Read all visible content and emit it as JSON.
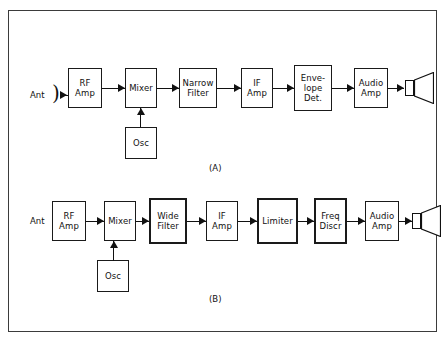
{
  "figure": {
    "frame_color": "#3b3b3b",
    "line_color": "#111111",
    "background": "#ffffff"
  },
  "diagram_a": {
    "caption": "(A)",
    "antenna_label": "Ant",
    "antenna_symbol": ")",
    "speaker_name": "loudspeaker",
    "blocks": [
      {
        "id": "rf_amp",
        "label": "RF\nAmp",
        "emphasis": "normal"
      },
      {
        "id": "mixer",
        "label": "Mixer",
        "emphasis": "normal"
      },
      {
        "id": "osc",
        "label": "Osc",
        "emphasis": "normal"
      },
      {
        "id": "narrow_filter",
        "label": "Narrow\nFilter",
        "emphasis": "normal"
      },
      {
        "id": "if_amp",
        "label": "IF\nAmp",
        "emphasis": "normal"
      },
      {
        "id": "env_det",
        "label": "Enve-\nlope\nDet.",
        "emphasis": "normal"
      },
      {
        "id": "audio_amp",
        "label": "Audio\nAmp",
        "emphasis": "normal"
      }
    ]
  },
  "diagram_b": {
    "caption": "(B)",
    "antenna_label": "Ant",
    "antenna_symbol": ")",
    "speaker_name": "loudspeaker",
    "blocks": [
      {
        "id": "rf_amp",
        "label": "RF\nAmp",
        "emphasis": "normal"
      },
      {
        "id": "mixer",
        "label": "Mixer",
        "emphasis": "normal"
      },
      {
        "id": "osc",
        "label": "Osc",
        "emphasis": "normal"
      },
      {
        "id": "wide_filter",
        "label": "Wide\nFilter",
        "emphasis": "bold"
      },
      {
        "id": "if_amp",
        "label": "IF\nAmp",
        "emphasis": "normal"
      },
      {
        "id": "limiter",
        "label": "Limiter",
        "emphasis": "bold"
      },
      {
        "id": "freq_discr",
        "label": "Freq\nDiscr",
        "emphasis": "bold"
      },
      {
        "id": "audio_amp",
        "label": "Audio\nAmp",
        "emphasis": "normal"
      }
    ]
  }
}
